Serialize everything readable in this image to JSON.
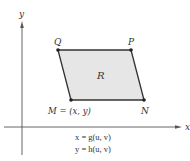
{
  "diagram": {
    "axes": {
      "x_label": "x",
      "y_label": "y"
    },
    "region": {
      "label": "R",
      "fill_color": "#e6e6e6",
      "edge_color": "#333333"
    },
    "vertices": {
      "Q": {
        "label": "Q"
      },
      "P": {
        "label": "P"
      },
      "M": {
        "label": "M = (x, y)"
      },
      "N": {
        "label": "N"
      }
    },
    "equations": {
      "line1": "x = g(u, v)",
      "line2": "y = h(u, v)"
    }
  }
}
